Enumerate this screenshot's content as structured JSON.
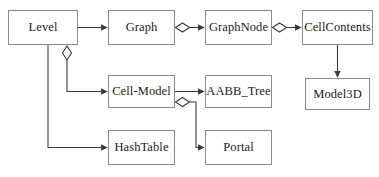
{
  "diagram": {
    "type": "class-relationship-diagram",
    "notation": "UML-like aggregation/association",
    "background_color": "#ffffff",
    "box_border_color": "#8a8a8a",
    "edge_color": "#3a3a3a",
    "text_color": "#1a1a1a",
    "nodes": [
      {
        "id": "level",
        "label": "Level",
        "x": 8,
        "y": 10,
        "w": 70,
        "h": 35
      },
      {
        "id": "graph",
        "label": "Graph",
        "x": 108,
        "y": 10,
        "w": 67,
        "h": 35
      },
      {
        "id": "graphnode",
        "label": "GraphNode",
        "x": 205,
        "y": 10,
        "w": 67,
        "h": 35
      },
      {
        "id": "cellcontents",
        "label": "CellContents",
        "x": 302,
        "y": 10,
        "w": 71,
        "h": 35
      },
      {
        "id": "model3d",
        "label": "Model3D",
        "x": 305,
        "y": 78,
        "w": 65,
        "h": 32
      },
      {
        "id": "cellmodel",
        "label": "Cell-Model",
        "x": 108,
        "y": 75,
        "w": 67,
        "h": 33
      },
      {
        "id": "aabbtree",
        "label": "AABB_Tree",
        "x": 205,
        "y": 75,
        "w": 67,
        "h": 33
      },
      {
        "id": "hashtable",
        "label": "HashTable",
        "x": 108,
        "y": 130,
        "w": 67,
        "h": 35
      },
      {
        "id": "portal",
        "label": "Portal",
        "x": 205,
        "y": 130,
        "w": 67,
        "h": 35
      }
    ],
    "edges": [
      {
        "id": "level-graph",
        "from": "level",
        "to": "graph",
        "arrow": true,
        "diamond": false
      },
      {
        "id": "graph-graphnode",
        "from": "graph",
        "to": "graphnode",
        "arrow": true,
        "diamond": true
      },
      {
        "id": "graphnode-cellcontents",
        "from": "graphnode",
        "to": "cellcontents",
        "arrow": true,
        "diamond": true
      },
      {
        "id": "cellcontents-model3d",
        "from": "cellcontents",
        "to": "model3d",
        "arrow": true,
        "diamond": false
      },
      {
        "id": "level-cellmodel",
        "from": "level",
        "to": "cellmodel",
        "arrow": true,
        "diamond": true
      },
      {
        "id": "level-hashtable",
        "from": "level",
        "to": "hashtable",
        "arrow": true,
        "diamond": false
      },
      {
        "id": "cellmodel-aabbtree",
        "from": "cellmodel",
        "to": "aabbtree",
        "arrow": true,
        "diamond": false
      },
      {
        "id": "cellmodel-portal",
        "from": "cellmodel",
        "to": "portal",
        "arrow": true,
        "diamond": true
      }
    ]
  }
}
